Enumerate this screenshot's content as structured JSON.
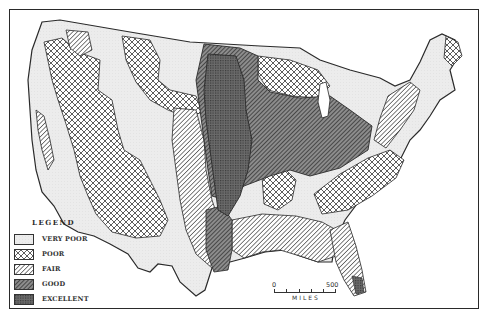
{
  "map": {
    "subject": "Agricultural land quality of the conterminous United States",
    "border_color": "#2a2a2a",
    "background": "#ffffff"
  },
  "legend": {
    "title": "LEGEND",
    "items": [
      {
        "label": "VERY POOR",
        "pattern": "very-poor",
        "fill": "#ebebeb"
      },
      {
        "label": "POOR",
        "pattern": "poor",
        "fill": "#ffffff"
      },
      {
        "label": "FAIR",
        "pattern": "fair",
        "fill": "#ffffff"
      },
      {
        "label": "GOOD",
        "pattern": "good",
        "fill": "#9a9a9a"
      },
      {
        "label": "EXCELLENT",
        "pattern": "excellent",
        "fill": "#6e6e6e"
      }
    ]
  },
  "scale": {
    "start": "0",
    "end": "500",
    "unit": "MILES"
  }
}
